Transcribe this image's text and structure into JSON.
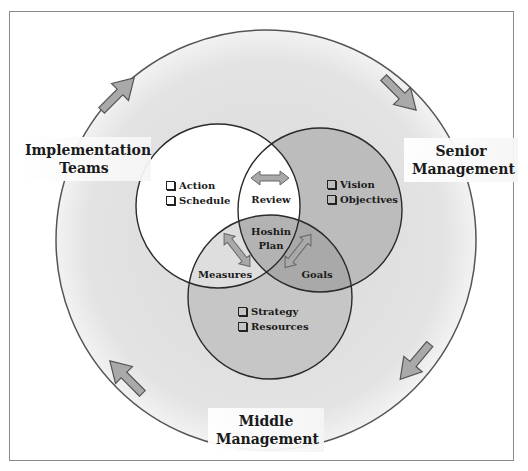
{
  "diagram": {
    "roles": [
      {
        "id": "implementation",
        "line1": "Implementation",
        "line2": "Teams"
      },
      {
        "id": "senior",
        "line1": "Senior",
        "line2": "Management"
      },
      {
        "id": "middle",
        "line1": "Middle",
        "line2": "Management"
      }
    ],
    "circles": {
      "left": {
        "items": [
          "Action",
          "Schedule"
        ],
        "fill": "#ffffff"
      },
      "right": {
        "items": [
          "Vision",
          "Objectives"
        ],
        "fill": "#bdbdbd"
      },
      "bottom": {
        "items": [
          "Strategy",
          "Resources"
        ],
        "fill": "#c9c9c9"
      }
    },
    "intersections": {
      "left_right": "Review",
      "left_bottom": "Measures",
      "right_bottom": "Goals",
      "center_line1": "Hoshin",
      "center_line2": "Plan"
    },
    "colors": {
      "outer_ring_fill": "#e6e6e6",
      "outer_ring_stroke": "#555555",
      "arrow_fill": "#a9a9a9",
      "arrow_stroke": "#555555",
      "circle_stroke": "#2a2a2a"
    }
  }
}
